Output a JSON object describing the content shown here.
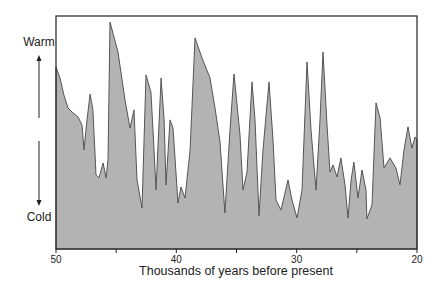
{
  "chart_data": {
    "type": "area",
    "title": "",
    "xlabel": "Thousands of years before present",
    "ylabel": "",
    "y_annotations": {
      "top": "Warm",
      "bottom": "Cold"
    },
    "xlim": [
      50,
      20
    ],
    "ylim": [
      0,
      100
    ],
    "y_units": "relative warmth index (0 = plot bottom, 100 = plot top)",
    "x_ticks": [
      50,
      45,
      40,
      35,
      30,
      25,
      20
    ],
    "x_tick_labels": [
      "50",
      "",
      "40",
      "",
      "30",
      "",
      "20"
    ],
    "grid": false,
    "legend": null,
    "fill_color": "#b3b3b3",
    "line_color": "#555555",
    "series": [
      {
        "name": "temperature proxy",
        "x": [
          50.0,
          49.67,
          49.34,
          49.0,
          48.67,
          48.17,
          47.84,
          47.67,
          47.42,
          47.17,
          46.93,
          46.68,
          46.43,
          46.09,
          45.84,
          45.68,
          45.51,
          44.85,
          44.27,
          43.85,
          43.52,
          43.27,
          42.85,
          42.52,
          42.11,
          41.94,
          41.69,
          41.27,
          41.02,
          40.86,
          40.53,
          40.28,
          39.86,
          39.61,
          39.28,
          38.86,
          38.45,
          37.87,
          37.2,
          36.79,
          36.37,
          35.96,
          35.54,
          35.21,
          34.71,
          34.46,
          34.13,
          33.71,
          33.46,
          33.13,
          32.8,
          32.3,
          31.97,
          31.72,
          31.3,
          30.72,
          30.39,
          29.97,
          29.56,
          29.14,
          28.81,
          28.39,
          28.06,
          27.81,
          27.48,
          27.23,
          26.98,
          26.65,
          26.32,
          25.98,
          25.73,
          25.48,
          25.24,
          24.9,
          24.57,
          24.24,
          24.16,
          23.74,
          23.41,
          23.07,
          22.74,
          22.24,
          21.75,
          21.41,
          21.08,
          20.75,
          20.42,
          20.17,
          20.0
        ],
        "values": [
          78.1,
          73.4,
          66.1,
          60.5,
          58.8,
          56.7,
          53.2,
          42.5,
          55.4,
          66.5,
          59.7,
          31.8,
          30.5,
          36.9,
          30.5,
          38.2,
          97.4,
          84.5,
          63.9,
          51.9,
          59.7,
          29.6,
          17.6,
          74.7,
          67.4,
          51.1,
          25.3,
          73.4,
          55.4,
          27.5,
          55.4,
          51.9,
          19.7,
          26.6,
          21.9,
          42.5,
          90.6,
          82.0,
          73.4,
          60.5,
          45.9,
          15.5,
          51.1,
          75.1,
          48.9,
          25.3,
          33.0,
          71.7,
          55.4,
          14.2,
          42.5,
          71.7,
          46.8,
          21.0,
          16.7,
          29.6,
          21.0,
          13.3,
          25.3,
          80.3,
          51.1,
          25.3,
          55.4,
          84.5,
          53.2,
          33.0,
          36.1,
          30.9,
          39.1,
          27.5,
          13.3,
          29.6,
          37.3,
          21.9,
          33.9,
          25.3,
          12.9,
          18.9,
          62.7,
          56.2,
          34.8,
          39.1,
          34.8,
          27.5,
          42.5,
          52.4,
          43.3,
          48.1,
          46.8
        ]
      }
    ]
  }
}
